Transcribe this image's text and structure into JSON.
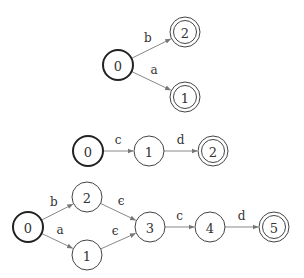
{
  "diagrams": [
    {
      "name": "dfa-1",
      "nodes": [
        {
          "id": "0",
          "label": "0",
          "x": 118,
          "y": 65,
          "start": true,
          "accept": false
        },
        {
          "id": "2",
          "label": "2",
          "x": 185,
          "y": 32,
          "start": false,
          "accept": true
        },
        {
          "id": "1",
          "label": "1",
          "x": 185,
          "y": 97,
          "start": false,
          "accept": true
        }
      ],
      "edges": [
        {
          "from": "0",
          "to": "2",
          "label": "b"
        },
        {
          "from": "0",
          "to": "1",
          "label": "a"
        }
      ]
    },
    {
      "name": "dfa-2",
      "nodes": [
        {
          "id": "0",
          "label": "0",
          "x": 88,
          "y": 151,
          "start": true,
          "accept": false
        },
        {
          "id": "1",
          "label": "1",
          "x": 149,
          "y": 151,
          "start": false,
          "accept": false
        },
        {
          "id": "2",
          "label": "2",
          "x": 213,
          "y": 151,
          "start": false,
          "accept": true
        }
      ],
      "edges": [
        {
          "from": "0",
          "to": "1",
          "label": "c"
        },
        {
          "from": "1",
          "to": "2",
          "label": "d"
        }
      ]
    },
    {
      "name": "nfa-3",
      "nodes": [
        {
          "id": "0",
          "label": "0",
          "x": 28,
          "y": 227,
          "start": true,
          "accept": false
        },
        {
          "id": "2",
          "label": "2",
          "x": 87,
          "y": 197,
          "start": false,
          "accept": false
        },
        {
          "id": "1",
          "label": "1",
          "x": 87,
          "y": 255,
          "start": false,
          "accept": false
        },
        {
          "id": "3",
          "label": "3",
          "x": 150,
          "y": 227,
          "start": false,
          "accept": false
        },
        {
          "id": "4",
          "label": "4",
          "x": 210,
          "y": 227,
          "start": false,
          "accept": false
        },
        {
          "id": "5",
          "label": "5",
          "x": 274,
          "y": 227,
          "start": false,
          "accept": true
        }
      ],
      "edges": [
        {
          "from": "0",
          "to": "2",
          "label": "b"
        },
        {
          "from": "0",
          "to": "1",
          "label": "a"
        },
        {
          "from": "2",
          "to": "3",
          "label": "ϵ"
        },
        {
          "from": "1",
          "to": "3",
          "label": "ϵ"
        },
        {
          "from": "3",
          "to": "4",
          "label": "c"
        },
        {
          "from": "4",
          "to": "5",
          "label": "d"
        }
      ]
    }
  ],
  "style": {
    "node_radius": 15,
    "edge_color": "#888888",
    "node_stroke": "#444444",
    "start_stroke": "#222222"
  }
}
